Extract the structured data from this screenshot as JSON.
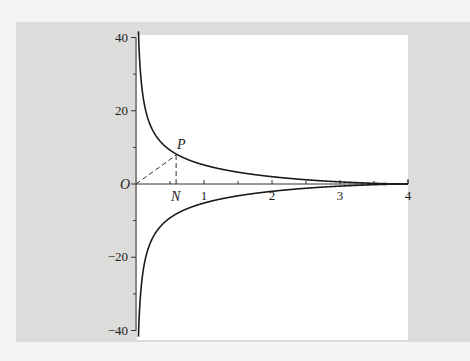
{
  "chart_data": {
    "type": "line",
    "title": "",
    "xlabel": "",
    "ylabel": "",
    "xlim": [
      0,
      4
    ],
    "ylim": [
      -40,
      40
    ],
    "x_ticks": [
      1,
      2,
      3,
      4
    ],
    "x_tick_labels": [
      "1",
      "2",
      "3",
      "4"
    ],
    "x_minor_ticks": [
      0.5,
      1.5,
      2.5,
      3.5
    ],
    "y_ticks": [
      -40,
      -20,
      0,
      20,
      40
    ],
    "y_tick_labels": [
      "-40",
      "-20",
      "",
      "20",
      "40"
    ],
    "y_minor_ticks": [
      -30,
      -10,
      10,
      30
    ],
    "grid": false,
    "equation": "y^2 = (4 - x)^3 / x",
    "series": [
      {
        "name": "upper branch",
        "x": [
          0.03,
          0.13,
          0.3,
          0.59,
          1,
          2,
          3,
          4
        ],
        "y": [
          45,
          20,
          12,
          7.9,
          5.2,
          2.0,
          0.58,
          0
        ]
      },
      {
        "name": "lower branch",
        "x": [
          0.03,
          0.13,
          0.3,
          0.59,
          1,
          2,
          3,
          4
        ],
        "y": [
          -45,
          -20,
          -12,
          -7.9,
          -5.2,
          -2.0,
          -0.58,
          0
        ]
      }
    ],
    "annotations": [
      {
        "label": "O",
        "x": 0,
        "y": 0
      },
      {
        "label": "P",
        "x": 0.59,
        "y": 7.9
      },
      {
        "label": "N",
        "x": 0.59,
        "y": 0
      }
    ],
    "guides": [
      {
        "from": "O",
        "to": "P",
        "style": "dashed"
      },
      {
        "from": "P",
        "to": "N",
        "style": "dashed"
      }
    ]
  },
  "labels": {
    "origin": "O",
    "point_p": "P",
    "point_n": "N"
  }
}
